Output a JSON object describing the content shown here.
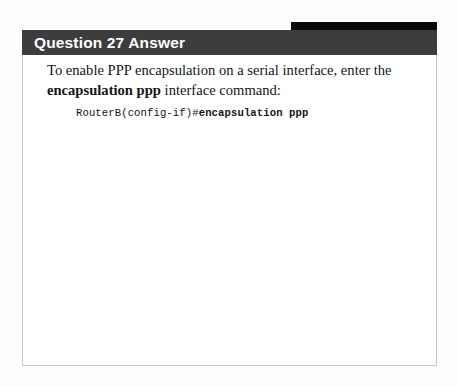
{
  "page": {
    "background_color": "#fdfdfd"
  },
  "accent_strip": {
    "color": "#0a0a0a"
  },
  "card": {
    "border_color": "#c6c6c6",
    "background_color": "#ffffff",
    "header": {
      "title": "Question 27 Answer",
      "background_color": "#3d3d3d",
      "text_color": "#ffffff"
    },
    "body": {
      "paragraph": {
        "lead_text": "To enable PPP encapsulation on a serial interface, enter the ",
        "bold_command": "encapsulation ppp",
        "trailing_text": " interface command:"
      },
      "code": {
        "prompt": "RouterB(config-if)#",
        "command": "encapsulation ppp"
      }
    }
  }
}
